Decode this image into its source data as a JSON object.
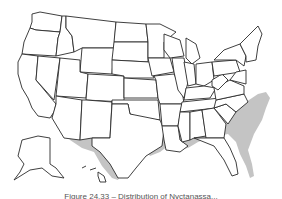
{
  "map": {
    "type": "range-map",
    "region": "United States",
    "shaded_color": "#c4c4c4",
    "outline_color": "#2a2a2a",
    "background": "#ffffff",
    "shaded_regions": [
      "Southern Oregon coast",
      "California",
      "Southern Nevada",
      "Arizona",
      "Southern New Mexico",
      "Texas",
      "Southern Oklahoma",
      "Louisiana",
      "Mississippi",
      "Alabama",
      "Georgia",
      "Florida",
      "South Carolina",
      "North Carolina",
      "Southern Virginia",
      "Southern Arkansas",
      "Southern Tennessee"
    ]
  },
  "caption": {
    "text": "Figure 24.33 – Distribution of Nyctanassa..."
  }
}
